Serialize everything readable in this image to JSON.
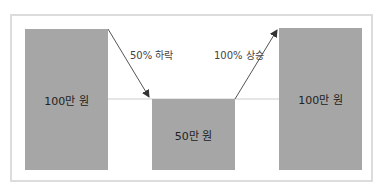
{
  "diagram": {
    "bars": [
      {
        "label": "100만 원",
        "value": 100
      },
      {
        "label": "50만 원",
        "value": 50
      },
      {
        "label": "100만 원",
        "value": 100
      }
    ],
    "arrows": [
      {
        "label": "50% 하락",
        "direction": "down"
      },
      {
        "label": "100% 상승",
        "direction": "up"
      }
    ],
    "colors": {
      "bar": "#a6a6a6",
      "frame": "#dcdcdc",
      "arrow": "#444444",
      "baseline": "#cccccc"
    }
  }
}
